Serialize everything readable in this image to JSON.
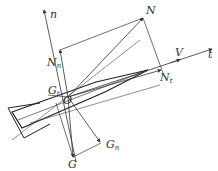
{
  "diagram": {
    "type": "force-decomposition",
    "labels": {
      "n_axis": "n",
      "t_axis": "t",
      "N": "N",
      "N_n": {
        "base": "N",
        "sub": "n"
      },
      "N_t": {
        "base": "N",
        "sub": "t"
      },
      "V": "V",
      "O": "O",
      "G": "G",
      "G_n": {
        "base": "G",
        "sub": "n"
      },
      "G_t": {
        "base": "G",
        "sub": "t"
      }
    },
    "colors": {
      "line": "#333333",
      "background": "#ffffff"
    }
  }
}
